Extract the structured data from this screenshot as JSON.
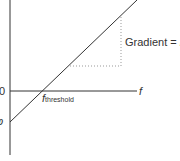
{
  "diagram": {
    "origin_label": "0",
    "intercept_label": "φ",
    "x_axis_label": "f",
    "threshold_label": "f",
    "threshold_sub": "threshold",
    "gradient_text": "Gradient = ",
    "gradient_symbol": "h",
    "colors": {
      "line": "#333333",
      "dotted": "#999999",
      "text": "#333333"
    }
  }
}
